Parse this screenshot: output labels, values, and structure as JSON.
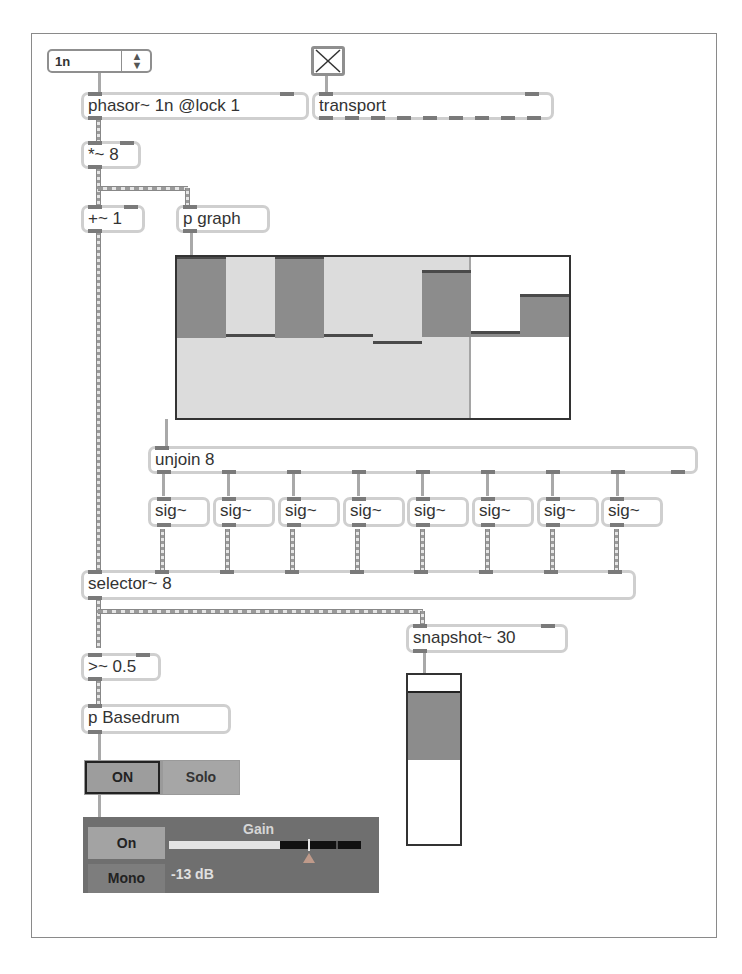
{
  "patcher": {
    "umenu": {
      "value": "1n",
      "arrows_icon": "up-down-arrows-icon"
    },
    "toggle": {
      "checked": true,
      "icon": "x-mark-icon"
    },
    "objects": {
      "phasor": "phasor~ 1n @lock 1",
      "transport": "transport",
      "times": "*~ 8",
      "plus": "+~ 1",
      "pgraph": "p graph",
      "unjoin": "unjoin 8",
      "sig": [
        "sig~",
        "sig~",
        "sig~",
        "sig~",
        "sig~",
        "sig~",
        "sig~",
        "sig~"
      ],
      "selector": "selector~ 8",
      "snapshot": "snapshot~ 30",
      "gte": ">~ 0.5",
      "basedrum": "p Basedrum"
    },
    "multislider": {
      "num_sliders": 8,
      "range": [
        -1,
        1
      ],
      "values": [
        1.0,
        0.03,
        1.0,
        0.03,
        -0.05,
        0.83,
        0.07,
        0.53
      ],
      "playhead_index": 6,
      "colors": {
        "dark": "#8c8c8c",
        "light": "#dcdcdc",
        "line": "#4a4a4a"
      }
    },
    "meter": {
      "value": 0.64,
      "range": [
        0,
        1
      ]
    },
    "mute_solo": {
      "on_label": "ON",
      "solo_label": "Solo"
    },
    "gain": {
      "title": "Gain",
      "on_label": "On",
      "mono_label": "Mono",
      "value_label": "-13 dB"
    }
  }
}
